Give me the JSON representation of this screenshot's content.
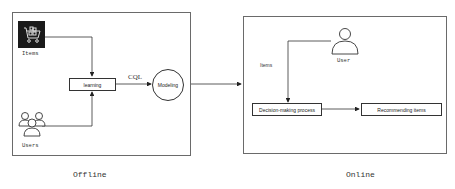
{
  "offline": {
    "title": "Offline",
    "items_label": "Items",
    "users_label": "Users",
    "learning_label": "learning",
    "edge_label": "CQL",
    "modeling_label": "Modeling"
  },
  "online": {
    "title": "Online",
    "user_label": "User",
    "items_edge_label": "Items",
    "decision_label": "Decision-making process",
    "recommend_label": "Recommending items"
  },
  "colors": {
    "stroke": "#333333",
    "panel_border": "#6a6a6a",
    "items_icon_bg": "#1a1a1a"
  }
}
